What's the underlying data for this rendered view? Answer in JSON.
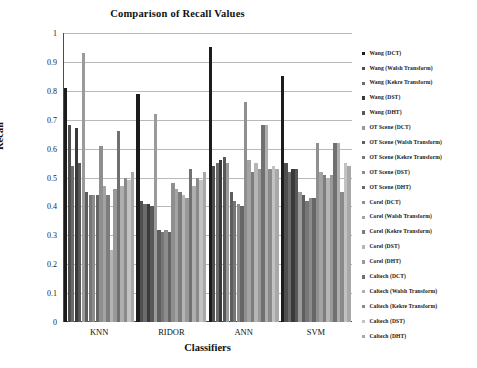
{
  "chart_data": {
    "type": "bar",
    "title": "Comparison of Recall Values",
    "xlabel": "Classifiers",
    "ylabel": "Recall",
    "categories": [
      "KNN",
      "RIDOR",
      "ANN",
      "SVM"
    ],
    "ylim": [
      0,
      1
    ],
    "yticks": [
      0,
      0.1,
      0.2,
      0.3,
      0.4,
      0.5,
      0.6,
      0.7,
      0.8,
      0.9,
      1
    ],
    "ytick_labels": [
      "0",
      "0.1",
      "0.2",
      "0.3",
      "0.4",
      "0.5",
      "0.6",
      "0.7",
      "0.8",
      "0.9",
      "1"
    ],
    "grid": true,
    "legend_position": "right",
    "series": [
      {
        "name": "Wang (DCT)",
        "color": "#1c1c1c",
        "values": [
          0.81,
          0.79,
          0.95,
          0.85
        ]
      },
      {
        "name": "Wang (Walsh Transform)",
        "color": "#4f4f4f",
        "values": [
          0.68,
          0.42,
          0.54,
          0.55
        ]
      },
      {
        "name": "Wang (Kekre Transform)",
        "color": "#6b6b6b",
        "values": [
          0.54,
          0.41,
          0.55,
          0.52
        ]
      },
      {
        "name": "Wang (DST)",
        "color": "#3a3a3a",
        "values": [
          0.67,
          0.41,
          0.56,
          0.53
        ]
      },
      {
        "name": "Wang (DHT)",
        "color": "#585858",
        "values": [
          0.55,
          0.4,
          0.57,
          0.53
        ]
      },
      {
        "name": "OT Scene (DCT)",
        "color": "#9a9a9a",
        "values": [
          0.93,
          0.72,
          0.55,
          0.45
        ]
      },
      {
        "name": "OT Scene (Walsh Transform)",
        "color": "#5e5e5e",
        "values": [
          0.45,
          0.32,
          0.45,
          0.44
        ]
      },
      {
        "name": "OT Scene (Kekre Transform)",
        "color": "#767676",
        "values": [
          0.44,
          0.31,
          0.42,
          0.42
        ]
      },
      {
        "name": "OT Scene (DST)",
        "color": "#8c8c8c",
        "values": [
          0.44,
          0.32,
          0.41,
          0.43
        ]
      },
      {
        "name": "OT Scene (DHT)",
        "color": "#666666",
        "values": [
          0.44,
          0.31,
          0.4,
          0.43
        ]
      },
      {
        "name": "Corel (DCT)",
        "color": "#8f8f8f",
        "values": [
          0.61,
          0.48,
          0.76,
          0.62
        ]
      },
      {
        "name": "Corel (Walsh Transform)",
        "color": "#a3a3a3",
        "values": [
          0.47,
          0.46,
          0.56,
          0.52
        ]
      },
      {
        "name": "Corel (Kekre Transform)",
        "color": "#7d7d7d",
        "values": [
          0.44,
          0.45,
          0.52,
          0.51
        ]
      },
      {
        "name": "Corel (DST)",
        "color": "#b5b5b5",
        "values": [
          0.25,
          0.44,
          0.55,
          0.5
        ]
      },
      {
        "name": "Corel (DHT)",
        "color": "#999999",
        "values": [
          0.46,
          0.43,
          0.53,
          0.51
        ]
      },
      {
        "name": "Caltech (DCT)",
        "color": "#707070",
        "values": [
          0.66,
          0.53,
          0.68,
          0.62
        ]
      },
      {
        "name": "Caltech (Walsh Transform)",
        "color": "#aeaeae",
        "values": [
          0.47,
          0.47,
          0.68,
          0.62
        ]
      },
      {
        "name": "Caltech (Kekre Transform)",
        "color": "#8a8a8a",
        "values": [
          0.5,
          0.5,
          0.53,
          0.45
        ]
      },
      {
        "name": "Caltech (DST)",
        "color": "#c2c2c2",
        "values": [
          0.49,
          0.49,
          0.54,
          0.55
        ]
      },
      {
        "name": "Caltech (DHT)",
        "color": "#a8a8a8",
        "values": [
          0.52,
          0.52,
          0.53,
          0.54
        ]
      }
    ]
  }
}
